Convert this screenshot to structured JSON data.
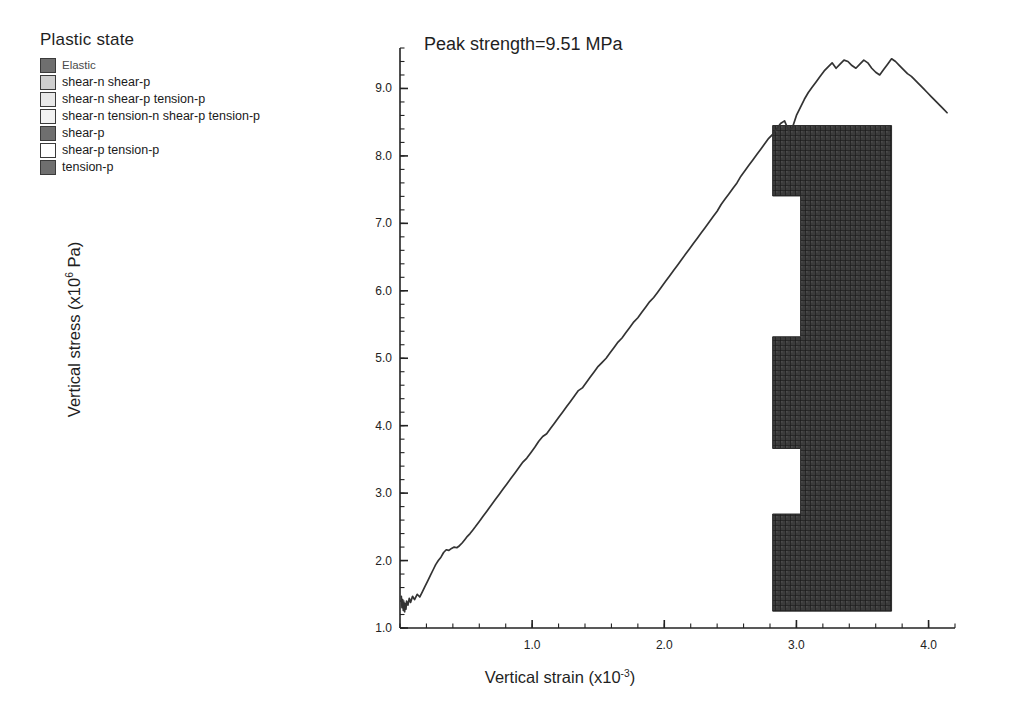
{
  "legend": {
    "title": "Plastic state",
    "items": [
      {
        "label": "Elastic",
        "color": "#6f6f6f",
        "small": true
      },
      {
        "label": "shear-n shear-p",
        "color": "#cfcfcf",
        "small": false
      },
      {
        "label": "shear-n shear-p tension-p",
        "color": "#e8e8e8",
        "small": false
      },
      {
        "label": "shear-n tension-n shear-p tension-p",
        "color": "#f2f2f2",
        "small": false
      },
      {
        "label": "shear-p",
        "color": "#6f6f6f",
        "small": false
      },
      {
        "label": "shear-p tension-p",
        "color": "#ffffff",
        "small": false
      },
      {
        "label": "tension-p",
        "color": "#6f6f6f",
        "small": false
      }
    ]
  },
  "chart_data": {
    "type": "line",
    "title": "Peak strength=9.51 MPa",
    "xlabel": "Vertical strain (x10",
    "xlabel_exp": "-3",
    "xlabel_tail": ")",
    "ylabel": "Vertical stress (x10",
    "ylabel_exp": "6",
    "ylabel_tail": " Pa)",
    "xlim": [
      0.0,
      4.2
    ],
    "ylim": [
      1.0,
      9.6
    ],
    "xticks": [
      1.0,
      2.0,
      3.0,
      4.0
    ],
    "xtick_labels": [
      "1.0",
      "2.0",
      "3.0",
      "4.0"
    ],
    "yticks": [
      1.0,
      2.0,
      3.0,
      4.0,
      5.0,
      6.0,
      7.0,
      8.0,
      9.0
    ],
    "ytick_labels": [
      "1.0",
      "2.0",
      "3.0",
      "4.0",
      "5.0",
      "6.0",
      "7.0",
      "8.0",
      "9.0"
    ],
    "minor_tick_step_x": 0.2,
    "minor_tick_step_y": 0.2,
    "grid": false,
    "legend_position": "outside-top-left",
    "peak_strength_mpa": 9.51,
    "series": [
      {
        "name": "Vertical stress vs vertical strain",
        "color": "#333333",
        "x": [
          0.01,
          0.015,
          0.02,
          0.025,
          0.03,
          0.035,
          0.04,
          0.045,
          0.05,
          0.06,
          0.07,
          0.08,
          0.095,
          0.11,
          0.13,
          0.15,
          0.17,
          0.19,
          0.21,
          0.23,
          0.25,
          0.27,
          0.29,
          0.31,
          0.33,
          0.35,
          0.37,
          0.39,
          0.41,
          0.43,
          0.45,
          0.47,
          0.49,
          0.51,
          0.53,
          0.55,
          0.57,
          0.6,
          0.63,
          0.66,
          0.69,
          0.72,
          0.75,
          0.78,
          0.81,
          0.84,
          0.87,
          0.9,
          0.93,
          0.96,
          0.99,
          1.02,
          1.05,
          1.08,
          1.11,
          1.14,
          1.17,
          1.2,
          1.23,
          1.26,
          1.29,
          1.32,
          1.35,
          1.38,
          1.41,
          1.44,
          1.47,
          1.5,
          1.53,
          1.56,
          1.59,
          1.62,
          1.65,
          1.68,
          1.71,
          1.74,
          1.77,
          1.8,
          1.83,
          1.86,
          1.89,
          1.92,
          1.95,
          1.98,
          2.01,
          2.04,
          2.07,
          2.1,
          2.13,
          2.16,
          2.19,
          2.22,
          2.25,
          2.28,
          2.31,
          2.34,
          2.37,
          2.4,
          2.43,
          2.46,
          2.49,
          2.52,
          2.55,
          2.58,
          2.61,
          2.64,
          2.67,
          2.7,
          2.73,
          2.76,
          2.79,
          2.82,
          2.85,
          2.88,
          2.91,
          2.94,
          2.97,
          3.0,
          3.03,
          3.06,
          3.09,
          3.12,
          3.15,
          3.18,
          3.21,
          3.24,
          3.27,
          3.3,
          3.33,
          3.36,
          3.39,
          3.42,
          3.45,
          3.48,
          3.51,
          3.54,
          3.57,
          3.6,
          3.63,
          3.66,
          3.69,
          3.72,
          3.75,
          3.78,
          3.81,
          3.84,
          3.87,
          3.9,
          3.93,
          3.96,
          3.99,
          4.02,
          4.05,
          4.08,
          4.11,
          4.14
        ],
        "y": [
          1.47,
          1.3,
          1.42,
          1.26,
          1.38,
          1.24,
          1.36,
          1.28,
          1.4,
          1.34,
          1.44,
          1.38,
          1.47,
          1.42,
          1.5,
          1.46,
          1.54,
          1.62,
          1.7,
          1.78,
          1.86,
          1.94,
          2.0,
          2.05,
          2.12,
          2.16,
          2.15,
          2.18,
          2.2,
          2.19,
          2.22,
          2.26,
          2.31,
          2.36,
          2.4,
          2.45,
          2.5,
          2.58,
          2.66,
          2.74,
          2.82,
          2.9,
          2.98,
          3.06,
          3.14,
          3.22,
          3.3,
          3.38,
          3.46,
          3.52,
          3.6,
          3.68,
          3.77,
          3.84,
          3.88,
          3.96,
          4.04,
          4.12,
          4.2,
          4.28,
          4.36,
          4.44,
          4.52,
          4.56,
          4.64,
          4.72,
          4.8,
          4.88,
          4.94,
          5.0,
          5.08,
          5.16,
          5.24,
          5.3,
          5.38,
          5.46,
          5.54,
          5.6,
          5.68,
          5.76,
          5.84,
          5.9,
          5.98,
          6.06,
          6.14,
          6.22,
          6.3,
          6.38,
          6.46,
          6.54,
          6.62,
          6.7,
          6.78,
          6.86,
          6.94,
          7.02,
          7.1,
          7.18,
          7.28,
          7.36,
          7.44,
          7.52,
          7.6,
          7.7,
          7.78,
          7.86,
          7.94,
          8.02,
          8.1,
          8.18,
          8.26,
          8.32,
          8.4,
          8.48,
          8.52,
          8.38,
          8.42,
          8.6,
          8.72,
          8.84,
          8.94,
          9.02,
          9.1,
          9.18,
          9.26,
          9.32,
          9.38,
          9.3,
          9.36,
          9.42,
          9.4,
          9.34,
          9.3,
          9.36,
          9.42,
          9.38,
          9.3,
          9.24,
          9.2,
          9.28,
          9.36,
          9.44,
          9.4,
          9.34,
          9.28,
          9.22,
          9.18,
          9.12,
          9.06,
          9.0,
          8.94,
          8.88,
          8.82,
          8.76,
          8.7,
          8.64
        ]
      }
    ]
  },
  "mesh_inset": {
    "name": "plastic-state-mesh",
    "fill_color": "#3b3b3b",
    "description": "Dense FLAC zone plot of plastic state elements with two notched white regions on the left edge",
    "x_range": [
      2.82,
      3.72
    ],
    "y_range": [
      1.25,
      8.45
    ]
  }
}
